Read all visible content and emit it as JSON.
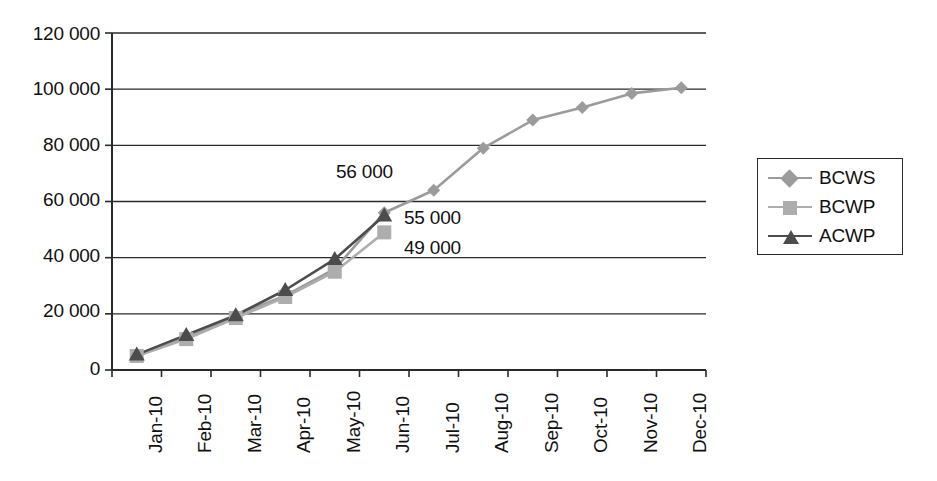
{
  "chart_data": {
    "type": "line",
    "title": "",
    "xlabel": "",
    "ylabel": "",
    "categories": [
      "Jan-10",
      "Feb-10",
      "Mar-10",
      "Apr-10",
      "May-10",
      "Jun-10",
      "Jul-10",
      "Aug-10",
      "Sep-10",
      "Oct-10",
      "Nov-10",
      "Dec-10"
    ],
    "ylim": [
      0,
      120000
    ],
    "ytick_values": [
      0,
      20000,
      40000,
      60000,
      80000,
      100000,
      120000
    ],
    "ytick_labels": [
      "0",
      "20 000",
      "40 000",
      "60 000",
      "80 000",
      "100 000",
      "120 000"
    ],
    "grid": "horizontal",
    "legend_position": "right",
    "series": [
      {
        "name": "BCWS",
        "marker": "diamond",
        "color": "#9b9b9b",
        "values": [
          5000,
          11500,
          19500,
          26500,
          36000,
          56000,
          64000,
          79000,
          89000,
          93500,
          98500,
          100500
        ]
      },
      {
        "name": "BCWP",
        "marker": "square",
        "color": "#adadad",
        "values": [
          5000,
          11000,
          18500,
          26000,
          35000,
          49000,
          null,
          null,
          null,
          null,
          null,
          null
        ]
      },
      {
        "name": "ACWP",
        "marker": "triangle",
        "color": "#4c4c4c",
        "values": [
          5500,
          12500,
          19500,
          28500,
          39500,
          55000,
          null,
          null,
          null,
          null,
          null,
          null
        ]
      }
    ],
    "annotations": [
      {
        "text": "56 000",
        "category": "Jun-10",
        "value": 56000
      },
      {
        "text": "55 000",
        "category": "Jun-10",
        "value": 55000
      },
      {
        "text": "49 000",
        "category": "Jun-10",
        "value": 49000
      }
    ]
  },
  "legend": {
    "items": [
      {
        "label": "BCWS"
      },
      {
        "label": "BCWP"
      },
      {
        "label": "ACWP"
      }
    ]
  }
}
